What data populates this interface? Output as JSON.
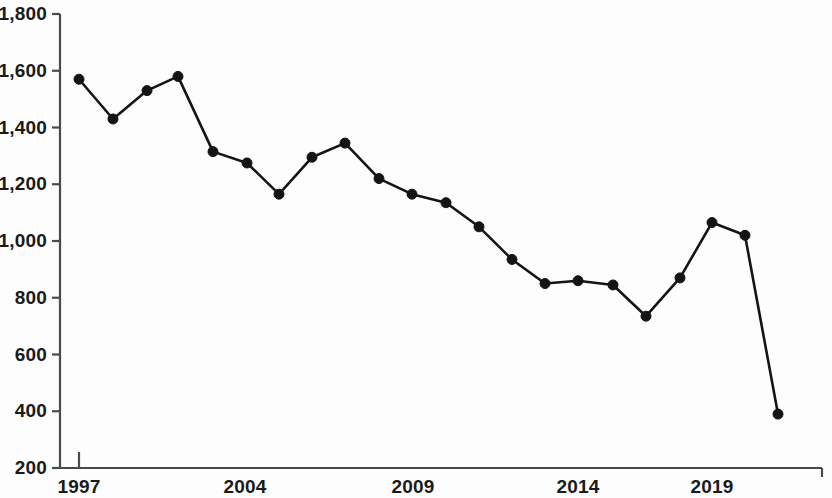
{
  "chart_data": {
    "type": "line",
    "title": "",
    "subtitle": "",
    "xlabel": "",
    "ylabel": "",
    "ylim": [
      200,
      1800
    ],
    "ytick_labels": [
      "1,800",
      "1,600",
      "1,400",
      "1,200",
      "1,000",
      "800",
      "600",
      "400",
      "200"
    ],
    "ytick_values": [
      1800,
      1600,
      1400,
      1200,
      1000,
      800,
      600,
      400,
      200
    ],
    "xtick_labels": [
      "1997",
      "2004",
      "2009",
      "2014",
      "2019"
    ],
    "xtick_x": [
      79,
      245,
      413,
      578,
      712
    ],
    "grid": false,
    "legend": null,
    "marker": "circle",
    "line_color": "#141414",
    "marker_color": "#141414",
    "axis_color": "#4a4a4a",
    "background": "#fdfdfd",
    "series": [
      {
        "name": "value",
        "x": [
          79,
          113,
          147,
          178,
          213,
          247,
          279,
          312,
          345,
          379,
          412,
          446,
          479,
          512,
          545,
          578,
          613,
          646,
          680,
          712,
          745,
          778
        ],
        "values": [
          1570,
          1430,
          1530,
          1580,
          1315,
          1275,
          1165,
          1295,
          1345,
          1220,
          1165,
          1135,
          1050,
          935,
          850,
          860,
          845,
          735,
          870,
          1065,
          1020,
          390
        ]
      }
    ]
  }
}
